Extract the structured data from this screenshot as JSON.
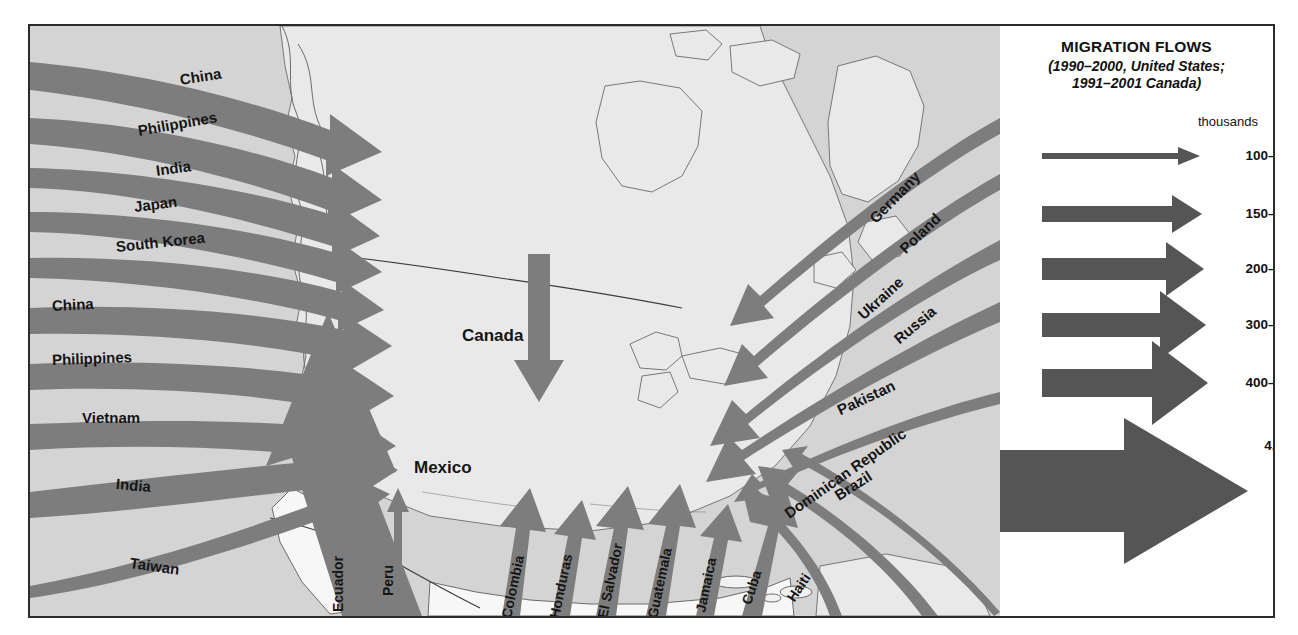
{
  "legend": {
    "title": "MIGRATION FLOWS",
    "subtitle_line1": "(1990–2000, United States;",
    "subtitle_line2": "1991–2001 Canada)",
    "units": "thousands",
    "accent_color": "#555555",
    "arrow_color": "#7d7d7d",
    "classes": [
      {
        "label": "100–149",
        "shaft_thickness": 4,
        "head_height": 14
      },
      {
        "label": "150–199",
        "shaft_thickness": 9,
        "head_height": 22
      },
      {
        "label": "200–299",
        "shaft_thickness": 15,
        "head_height": 32
      },
      {
        "label": "300–399",
        "shaft_thickness": 21,
        "head_height": 42
      },
      {
        "label": "400–562",
        "shaft_thickness": 28,
        "head_height": 55
      },
      {
        "label": "4,443",
        "shaft_thickness": 64,
        "head_height": 118
      }
    ]
  },
  "map": {
    "regions": {
      "west_pacific": "Asia–Pacific inflows (from left edge)",
      "east_atlantic": "Europe / South Asia inflows (from right edge)",
      "south": "Latin America and Caribbean inflows (from bottom edge)",
      "internal": "North American internal flows"
    },
    "flows": [
      {
        "origin": "China",
        "side": "west",
        "class": "200–299",
        "label_x": 150,
        "label_y": 45,
        "rotate": -9
      },
      {
        "origin": "Philippines",
        "side": "west",
        "class": "200–299",
        "label_x": 108,
        "label_y": 96,
        "rotate": -10
      },
      {
        "origin": "India",
        "side": "west",
        "class": "150–199",
        "label_x": 126,
        "label_y": 136,
        "rotate": -8
      },
      {
        "origin": "Japan",
        "side": "west",
        "class": "150–199",
        "label_x": 104,
        "label_y": 172,
        "rotate": -7
      },
      {
        "origin": "South Korea",
        "side": "west",
        "class": "150–199",
        "label_x": 86,
        "label_y": 212,
        "rotate": -6
      },
      {
        "origin": "China",
        "side": "west",
        "class": "300–399",
        "label_x": 44,
        "label_y": 271,
        "rotate": -3
      },
      {
        "origin": "Philippines",
        "side": "west",
        "class": "300–399",
        "label_x": 44,
        "label_y": 325,
        "rotate": -2
      },
      {
        "origin": "Vietnam",
        "side": "west",
        "class": "300–399",
        "label_x": 62,
        "label_y": 383,
        "rotate": 0
      },
      {
        "origin": "India",
        "side": "west",
        "class": "300–399",
        "label_x": 96,
        "label_y": 449,
        "rotate": 5
      },
      {
        "origin": "Taiwan",
        "side": "west",
        "class": "100–149",
        "label_x": 112,
        "label_y": 528,
        "rotate": 8
      },
      {
        "origin": "Germany",
        "side": "east",
        "class": "150–199",
        "label_x": 872,
        "label_y": 218,
        "rotate": -46
      },
      {
        "origin": "Poland",
        "side": "east",
        "class": "150–199",
        "label_x": 900,
        "label_y": 238,
        "rotate": -44
      },
      {
        "origin": "Ukraine",
        "side": "east",
        "class": "200–299",
        "label_x": 858,
        "label_y": 300,
        "rotate": -42
      },
      {
        "origin": "Russia",
        "side": "east",
        "class": "200–299",
        "label_x": 886,
        "label_y": 322,
        "rotate": -40
      },
      {
        "origin": "Pakistan",
        "side": "east",
        "class": "100–149",
        "label_x": 850,
        "label_y": 390,
        "rotate": -25
      },
      {
        "origin": "Ecuador",
        "side": "south",
        "class": "100–149",
        "label_x": 312,
        "label_y": 505,
        "rotate": -90
      },
      {
        "origin": "Peru",
        "side": "south",
        "class": "100–149",
        "label_x": 360,
        "label_y": 505,
        "rotate": -90
      },
      {
        "origin": "Colombia",
        "side": "south",
        "class": "300–399",
        "label_x": 483,
        "label_y": 520,
        "rotate": -78
      },
      {
        "origin": "Honduras",
        "side": "south",
        "class": "200–299",
        "label_x": 528,
        "label_y": 520,
        "rotate": -78
      },
      {
        "origin": "El Salvador",
        "side": "south",
        "class": "300–399",
        "label_x": 576,
        "label_y": 515,
        "rotate": -78
      },
      {
        "origin": "Guatemala",
        "side": "south",
        "class": "300–399",
        "label_x": 626,
        "label_y": 515,
        "rotate": -78
      },
      {
        "origin": "Jamaica",
        "side": "south",
        "class": "150–199",
        "label_x": 672,
        "label_y": 520,
        "rotate": -78
      },
      {
        "origin": "Cuba",
        "side": "south",
        "class": "300–399",
        "label_x": 722,
        "label_y": 527,
        "rotate": -72
      },
      {
        "origin": "Haiti",
        "side": "south",
        "class": "200–299",
        "label_x": 768,
        "label_y": 530,
        "rotate": -62
      },
      {
        "origin": "Dominican Republic",
        "side": "south",
        "class": "300–399",
        "label_x": 766,
        "label_y": 494,
        "rotate": -35
      },
      {
        "origin": "Brazil",
        "side": "south",
        "class": "100–149",
        "label_x": 810,
        "label_y": 472,
        "rotate": -33
      },
      {
        "origin": "Mexico",
        "side": "internal",
        "class": "4,443",
        "label_x": 404,
        "label_y": 443,
        "rotate": 0
      },
      {
        "origin": "Canada",
        "side": "internal",
        "class": "200–299",
        "label_x": 450,
        "label_y": 310,
        "rotate": 0
      }
    ]
  }
}
